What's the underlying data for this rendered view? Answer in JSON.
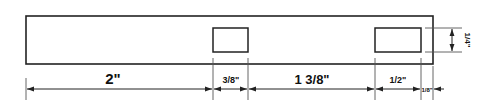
{
  "diagram": {
    "type": "dimensioned-part-drawing",
    "stroke_color": "#222222",
    "background": "#ffffff",
    "dimensions": {
      "d1": {
        "whole": "2",
        "num": "",
        "den": "",
        "unit": "\""
      },
      "d2": {
        "whole": "",
        "num": "3",
        "den": "8",
        "unit": "\""
      },
      "d3": {
        "whole": "1",
        "num": "3",
        "den": "8",
        "unit": "\""
      },
      "d4": {
        "whole": "",
        "num": "1",
        "den": "2",
        "unit": "\""
      },
      "d5": {
        "whole": "",
        "num": "1",
        "den": "8",
        "unit": "\""
      },
      "height": {
        "whole": "",
        "num": "1",
        "den": "4",
        "unit": "\""
      }
    },
    "labels": {
      "d1": "2\"",
      "d2": "3/8\"",
      "d3": "1 3/8\"",
      "d4": "1/2\"",
      "d5": "1/8\"",
      "slot_height": "1/4\""
    }
  }
}
